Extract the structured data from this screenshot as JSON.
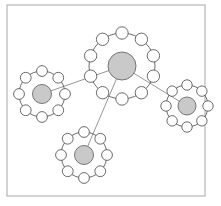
{
  "figure": {
    "width": 221,
    "height": 206,
    "background_color": "#ffffff"
  },
  "frame": {
    "name": "plot-frame",
    "x": 7,
    "y": 5,
    "width": 198,
    "height": 191,
    "stroke_color": "#b0b0b0",
    "stroke_width": 1.1,
    "fill": "#ffffff"
  },
  "style": {
    "ring_stroke_color": "#5a5a5a",
    "ring_stroke_width": 0.9,
    "ring_fill": "none",
    "core_fill_color": "#c9c9c9",
    "core_stroke_color": "#6a6a6a",
    "core_stroke_width": 0.9,
    "satellite_fill": "#ffffff",
    "satellite_stroke_color": "#5a5a5a",
    "satellite_stroke_width": 0.9,
    "edge_stroke_color": "#8a8a8a",
    "edge_stroke_width": 0.9
  },
  "chart_data": {
    "type": "diagram",
    "subtype": "node-link-graph",
    "xlabel": "",
    "ylabel": "",
    "xlim": [
      0,
      221
    ],
    "ylim": [
      0,
      206
    ],
    "grid": false,
    "legend": false,
    "node_count": 4,
    "edge_count": 3,
    "nodes": [
      {
        "id": "hub",
        "label": "hub-node",
        "role": "center",
        "cx": 122,
        "cy": 66,
        "ring_radius": 33,
        "core_radius": 14,
        "satellite_count": 10,
        "satellite_radius": 6.2,
        "satellite_start_angle": -90
      },
      {
        "id": "left",
        "label": "left-node",
        "role": "peripheral",
        "cx": 42,
        "cy": 94,
        "ring_radius": 23,
        "core_radius": 9.5,
        "satellite_count": 8,
        "satellite_radius": 5.4,
        "satellite_start_angle": -90
      },
      {
        "id": "bottom",
        "label": "bottom-node",
        "role": "peripheral",
        "cx": 84,
        "cy": 155,
        "ring_radius": 23,
        "core_radius": 9.5,
        "satellite_count": 8,
        "satellite_radius": 5.4,
        "satellite_start_angle": -90
      },
      {
        "id": "right",
        "label": "right-node",
        "role": "peripheral",
        "cx": 187,
        "cy": 106,
        "ring_radius": 21,
        "core_radius": 9,
        "satellite_count": 8,
        "satellite_radius": 5.2,
        "satellite_start_angle": -90
      }
    ],
    "edges": [
      {
        "id": "edge-hub-left",
        "source": "hub",
        "target": "left",
        "x1": 122,
        "y1": 66,
        "x2": 42,
        "y2": 94
      },
      {
        "id": "edge-hub-bottom",
        "source": "hub",
        "target": "bottom",
        "x1": 122,
        "y1": 66,
        "x2": 84,
        "y2": 155
      },
      {
        "id": "edge-hub-right",
        "source": "hub",
        "target": "right",
        "x1": 122,
        "y1": 66,
        "x2": 187,
        "y2": 106
      }
    ]
  }
}
